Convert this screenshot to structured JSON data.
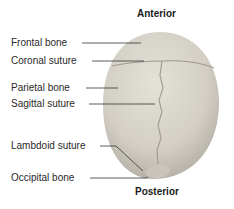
{
  "orientation": {
    "top": "Anterior",
    "bottom": "Posterior"
  },
  "labels": [
    {
      "text": "Frontal bone"
    },
    {
      "text": "Coronal suture"
    },
    {
      "text": "Parietal bone"
    },
    {
      "text": "Sagittal suture"
    },
    {
      "text": "Lambdoid suture"
    },
    {
      "text": "Occipital bone"
    }
  ],
  "colors": {
    "skull": "#d6d2c8",
    "skull_shadow": "#b9b4aa",
    "suture": "#9c978d",
    "leader": "#333333"
  }
}
